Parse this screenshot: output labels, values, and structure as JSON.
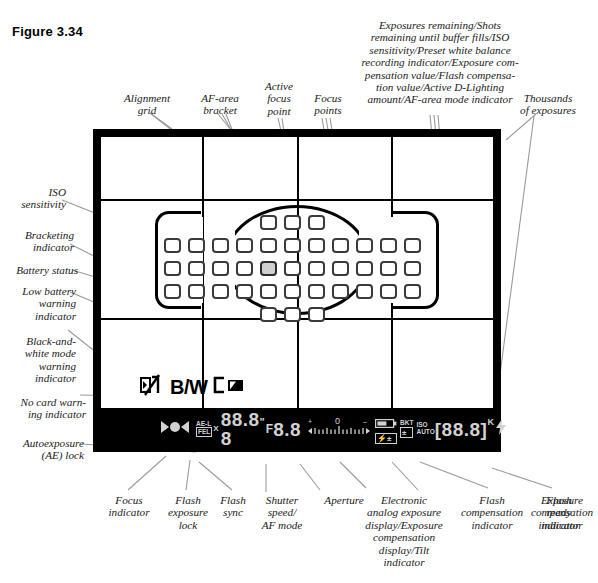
{
  "figure": {
    "caption": "Figure 3.34"
  },
  "callouts": {
    "top": [
      {
        "name": "alignment-grid",
        "text": "Alignment\ngrid"
      },
      {
        "name": "af-area-bracket",
        "text": "AF-area\nbracket"
      },
      {
        "name": "active-focus-point",
        "text": "Active\nfocus\npoint"
      },
      {
        "name": "focus-points",
        "text": "Focus\npoints"
      },
      {
        "name": "exposures-remaining",
        "text": "Exposures remaining/Shots\nremaining until buffer fills/ISO\nsensitivity/Preset white balance\nrecording indicator/Exposure com-\npensation value/Flash compensa-\ntion value/Active D-Lighting\namount/AF-area mode indicator"
      },
      {
        "name": "thousands-of-exposures",
        "text": "Thousands\nof exposures"
      }
    ],
    "left": [
      {
        "name": "iso-sensitivity",
        "text": "ISO\nsensitivity"
      },
      {
        "name": "bracketing-indicator",
        "text": "Bracketing\nindicator"
      },
      {
        "name": "battery-status",
        "text": "Battery status"
      },
      {
        "name": "low-battery-warning-indicator",
        "text": "Low battery\nwarning\nindicator"
      },
      {
        "name": "black-and-white-mode-warning-indicator",
        "text": "Black-and-\nwhite mode\nwarning\nindicator"
      },
      {
        "name": "no-card-warning-indicator",
        "text": "No card warn-\ning indicator"
      },
      {
        "name": "autoexposure-ae-lock",
        "text": "Autoexposure\n(AE) lock"
      }
    ],
    "bottom": [
      {
        "name": "focus-indicator",
        "text": "Focus\nindicator"
      },
      {
        "name": "flash-exposure-lock",
        "text": "Flash\nexposure\nlock"
      },
      {
        "name": "flash-sync",
        "text": "Flash\nsync"
      },
      {
        "name": "shutter-speed-af-mode",
        "text": "Shutter\nspeed/\nAF mode"
      },
      {
        "name": "aperture",
        "text": "Aperture"
      },
      {
        "name": "electronic-analog-exposure-display",
        "text": "Electronic\nanalog exposure\ndisplay/Exposure\ncompensation\ndisplay/Tilt\nindicator"
      },
      {
        "name": "flash-compensation-indicator",
        "text": "Flash\ncompensation\nindicator"
      },
      {
        "name": "exposure-compensation-indicator",
        "text": "Exposure\ncompensation\nindicator"
      },
      {
        "name": "flash-ready-indicator",
        "text": "Flash\nready\nindicator"
      }
    ]
  },
  "viewfinder": {
    "mode_icons": {
      "bw_label": "B/W"
    },
    "status_bar": {
      "ae_lock": "AE-L",
      "fe_lock": "FEL",
      "flash_sync": "X",
      "shutter_speed": "88.8 8",
      "shutter_unit": "\"",
      "aperture_prefix": "F",
      "aperture": "8.8",
      "analog_scale_zero": "0",
      "analog_scale_plus": "+",
      "analog_scale_minus": "–",
      "bracketing": "BKT",
      "iso_label": "ISO",
      "iso_auto": "AUTO",
      "frames_left": "88.8",
      "frames_bracket_open": "[",
      "frames_bracket_close": "]",
      "thousands": "K"
    }
  },
  "colors": {
    "frame": "#000000",
    "lcd_text": "#d2d2d2",
    "focus_point": "#3a3a3a",
    "selected_focus_point": "#cfcfcf",
    "leader": "#9a9a9a"
  }
}
